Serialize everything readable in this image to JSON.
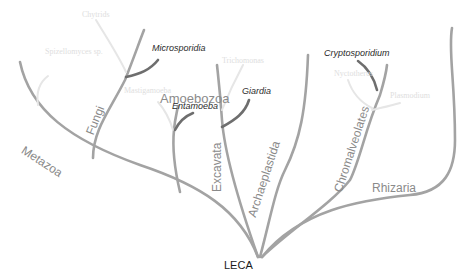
{
  "diagram": {
    "type": "phylogenetic-tree",
    "root": {
      "label": "LECA"
    },
    "supergroups": [
      {
        "label": "Metazoa"
      },
      {
        "label": "Fungi"
      },
      {
        "label": "Amoebozoa"
      },
      {
        "label": "Excavata"
      },
      {
        "label": "Archaeplastida"
      },
      {
        "label": "Chromalveolates"
      },
      {
        "label": "Rhizaria"
      }
    ],
    "highlighted_taxa": [
      {
        "label": "Microsporidia",
        "group": "Fungi"
      },
      {
        "label": "Entamoeba",
        "group": "Amoebozoa"
      },
      {
        "label": "Giardia",
        "group": "Excavata"
      },
      {
        "label": "Cryptosporidium",
        "group": "Chromalveolates"
      }
    ],
    "faded_taxa": [
      {
        "label": "Chytrids",
        "group": "Fungi"
      },
      {
        "label": "Spizellomyces sp.",
        "group": "Metazoa"
      },
      {
        "label": "Mastigamoeba",
        "group": "Amoebozoa"
      },
      {
        "label": "Trichomonas",
        "group": "Excavata"
      },
      {
        "label": "Nyctotherus",
        "group": "Chromalveolates"
      },
      {
        "label": "Plasmodium",
        "group": "Chromalveolates"
      }
    ],
    "colors": {
      "main_branch": "#a3a3a3",
      "highlight_branch": "#6e6e6e",
      "faded_branch": "#e6e6e6"
    }
  }
}
